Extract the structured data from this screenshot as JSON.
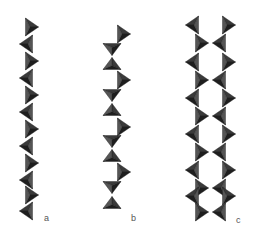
{
  "figure": {
    "colors": {
      "tetra_dark": "#1e1e1e",
      "tetra_mid": "#3a3a3a",
      "tetra_light": "#555555",
      "background": "#ffffff"
    },
    "panels": [
      {
        "id": "a",
        "label": "a",
        "label_pos": [
          44,
          219
        ],
        "structure": "single zigzag chain (period 2)",
        "tetrahedra": [
          {
            "dir": "right",
            "cx": 32,
            "cy": 27
          },
          {
            "dir": "left",
            "cx": 26,
            "cy": 44
          },
          {
            "dir": "right",
            "cx": 32,
            "cy": 61
          },
          {
            "dir": "left",
            "cx": 26,
            "cy": 78
          },
          {
            "dir": "right",
            "cx": 32,
            "cy": 95
          },
          {
            "dir": "left",
            "cx": 26,
            "cy": 112
          },
          {
            "dir": "right",
            "cx": 32,
            "cy": 129
          },
          {
            "dir": "left",
            "cx": 26,
            "cy": 146
          },
          {
            "dir": "right",
            "cx": 32,
            "cy": 163
          },
          {
            "dir": "left",
            "cx": 26,
            "cy": 180
          },
          {
            "dir": "right",
            "cx": 32,
            "cy": 195
          },
          {
            "dir": "left",
            "cx": 26,
            "cy": 211
          }
        ]
      },
      {
        "id": "b",
        "label": "b",
        "label_pos": [
          131,
          219
        ],
        "structure": "single chain (period 3)",
        "tetrahedra": [
          {
            "dir": "right",
            "cx": 124,
            "cy": 34
          },
          {
            "dir": "down",
            "cx": 112,
            "cy": 49
          },
          {
            "dir": "up",
            "cx": 112,
            "cy": 64
          },
          {
            "dir": "right",
            "cx": 124,
            "cy": 80
          },
          {
            "dir": "down",
            "cx": 112,
            "cy": 95
          },
          {
            "dir": "up",
            "cx": 112,
            "cy": 110
          },
          {
            "dir": "right",
            "cx": 124,
            "cy": 127
          },
          {
            "dir": "down",
            "cx": 112,
            "cy": 141
          },
          {
            "dir": "up",
            "cx": 112,
            "cy": 156
          },
          {
            "dir": "right",
            "cx": 124,
            "cy": 172
          },
          {
            "dir": "down",
            "cx": 112,
            "cy": 187
          },
          {
            "dir": "up",
            "cx": 112,
            "cy": 203
          }
        ]
      },
      {
        "id": "c",
        "label": "c",
        "label_pos": [
          236,
          221
        ],
        "structure": "double chain (band) forming six-membered rings",
        "tetrahedra": [
          {
            "dir": "left",
            "cx": 192,
            "cy": 25
          },
          {
            "dir": "right",
            "cx": 229,
            "cy": 25
          },
          {
            "dir": "right",
            "cx": 202,
            "cy": 43
          },
          {
            "dir": "left",
            "cx": 219,
            "cy": 43
          },
          {
            "dir": "left",
            "cx": 192,
            "cy": 62
          },
          {
            "dir": "right",
            "cx": 229,
            "cy": 62
          },
          {
            "dir": "right",
            "cx": 202,
            "cy": 80
          },
          {
            "dir": "left",
            "cx": 219,
            "cy": 80
          },
          {
            "dir": "left",
            "cx": 192,
            "cy": 98
          },
          {
            "dir": "right",
            "cx": 229,
            "cy": 98
          },
          {
            "dir": "right",
            "cx": 202,
            "cy": 116
          },
          {
            "dir": "left",
            "cx": 219,
            "cy": 116
          },
          {
            "dir": "left",
            "cx": 192,
            "cy": 134
          },
          {
            "dir": "right",
            "cx": 229,
            "cy": 134
          },
          {
            "dir": "right",
            "cx": 202,
            "cy": 152
          },
          {
            "dir": "left",
            "cx": 219,
            "cy": 152
          },
          {
            "dir": "left",
            "cx": 192,
            "cy": 170
          },
          {
            "dir": "right",
            "cx": 229,
            "cy": 170
          },
          {
            "dir": "right",
            "cx": 202,
            "cy": 188
          },
          {
            "dir": "left",
            "cx": 219,
            "cy": 188
          },
          {
            "dir": "left",
            "cx": 192,
            "cy": 196
          },
          {
            "dir": "right",
            "cx": 229,
            "cy": 196
          },
          {
            "dir": "right",
            "cx": 202,
            "cy": 212
          },
          {
            "dir": "left",
            "cx": 219,
            "cy": 212
          }
        ]
      }
    ]
  }
}
